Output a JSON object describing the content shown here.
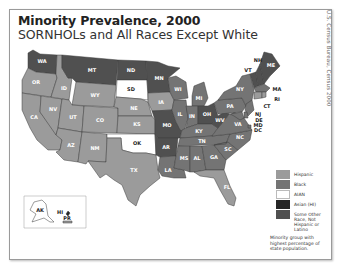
{
  "header": {
    "title": "Minority Prevalence, 2000",
    "subtitle": "SORNHOLs and All Races Except White",
    "source": "U.S. Census Bureau, Census 2000"
  },
  "colors": {
    "hispanic": "#9b9b9b",
    "black": "#747474",
    "aian": "#ffffff",
    "asian": "#262626",
    "other": "#505050",
    "border": "#3c3c3c"
  },
  "legend": {
    "items": [
      {
        "key": "hispanic",
        "label": "Hispanic"
      },
      {
        "key": "black",
        "label": "Black"
      },
      {
        "key": "aian",
        "label": "AIAN"
      },
      {
        "key": "asian",
        "label": "Asian (HI)"
      },
      {
        "key": "other",
        "label": "Some Other Race, Not Hispanic or Latino"
      }
    ],
    "note": "Minority group with highest percentage of state population."
  },
  "states": {
    "WA": "other",
    "OR": "hispanic",
    "CA": "hispanic",
    "NV": "hispanic",
    "ID": "hispanic",
    "MT": "other",
    "WY": "hispanic",
    "UT": "hispanic",
    "AZ": "hispanic",
    "CO": "hispanic",
    "NM": "hispanic",
    "ND": "other",
    "SD": "aian",
    "NE": "hispanic",
    "KS": "hispanic",
    "OK": "aian",
    "TX": "hispanic",
    "MN": "other",
    "IA": "hispanic",
    "MO": "other",
    "AR": "other",
    "LA": "black",
    "WI": "black",
    "IL": "black",
    "MI": "black",
    "IN": "black",
    "OH": "other",
    "KY": "black",
    "TN": "black",
    "MS": "black",
    "AL": "black",
    "GA": "black",
    "FL": "hispanic",
    "SC": "black",
    "NC": "black",
    "VA": "black",
    "WV": "other",
    "PA": "black",
    "NY": "black",
    "VT": "other",
    "NH": "other",
    "ME": "other",
    "MA": "black",
    "RI": "hispanic",
    "CT": "hispanic",
    "NJ": "black",
    "DE": "black",
    "MD": "black",
    "DC": "black",
    "AK": "aian",
    "HI": "asian",
    "PR": "hispanic"
  },
  "labels": {
    "WA": "WA",
    "OR": "OR",
    "CA": "CA",
    "NV": "NV",
    "ID": "ID",
    "MT": "MT",
    "WY": "WY",
    "UT": "UT",
    "AZ": "AZ",
    "CO": "CO",
    "NM": "NM",
    "ND": "ND",
    "SD": "SD",
    "NE": "NE",
    "KS": "KS",
    "OK": "OK",
    "TX": "TX",
    "MN": "MN",
    "IA": "IA",
    "MO": "MO",
    "AR": "AR",
    "LA": "LA",
    "WI": "WI",
    "IL": "IL",
    "MI": "MI",
    "IN": "IN",
    "OH": "OH",
    "KY": "KY",
    "TN": "TN",
    "MS": "MS",
    "AL": "AL",
    "GA": "GA",
    "FL": "FL",
    "SC": "SC",
    "NC": "NC",
    "VA": "VA",
    "WV": "WV",
    "PA": "PA",
    "NY": "NY",
    "VT": "VT",
    "NH": "NH",
    "ME": "ME",
    "MA": "MA",
    "RI": "RI",
    "CT": "CT",
    "NJ": "NJ",
    "DE": "DE",
    "MD": "MD",
    "DC": "DC",
    "AK": "AK",
    "HI": "HI",
    "PR": "PR"
  }
}
